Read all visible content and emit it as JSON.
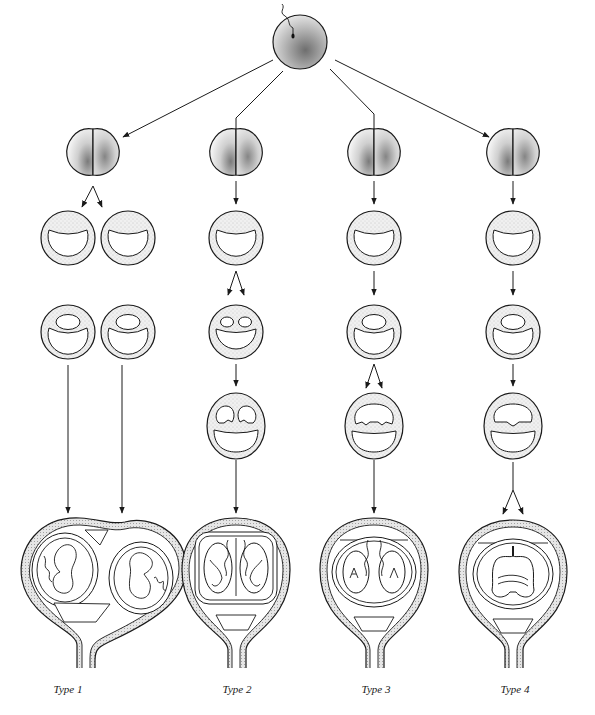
{
  "figure": {
    "stages": [
      "zygote",
      "two-cell stage",
      "blastocyst",
      "inner cell mass splitting",
      "placentation in uterus"
    ],
    "types": [
      {
        "label": "Type 1",
        "split_stage": "two-cell stage",
        "description": "separate blastocysts, separate placentas and chorions"
      },
      {
        "label": "Type 2",
        "split_stage": "blastocyst inner cell mass",
        "description": "shared chorion, two amnions"
      },
      {
        "label": "Type 3",
        "split_stage": "bilaminar disc",
        "description": "shared chorion, two partial amniotic sacs"
      },
      {
        "label": "Type 4",
        "split_stage": "after amnion formation",
        "description": "shared chorion and amnion, conjoined twins"
      }
    ]
  },
  "colors": {
    "line": "#1a1a1a",
    "stipple": "#8a8a8a",
    "background": "#ffffff"
  }
}
